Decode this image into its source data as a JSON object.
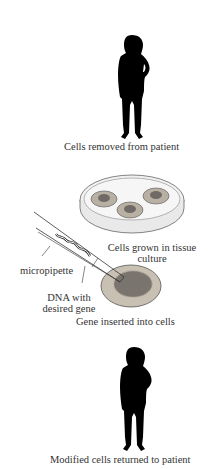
{
  "diagram": {
    "steps": [
      {
        "id": "step1",
        "label": "Cells removed from patient"
      },
      {
        "id": "step2",
        "label_line1": "Cells grown in tissue",
        "label_line2": "culture"
      },
      {
        "id": "step3",
        "label": "Gene inserted into cells"
      },
      {
        "id": "step4",
        "label": "Modified cells returned to patient"
      }
    ],
    "annotations": {
      "pipette": "micropipette",
      "dna_line1": "DNA with",
      "dna_line2": "desired gene"
    },
    "colors": {
      "silhouette": "#000000",
      "dish_rim": "#e8e8e8",
      "colony_outer": "#b9b0a4",
      "colony_inner": "#6f6a66",
      "text": "#333333"
    }
  }
}
